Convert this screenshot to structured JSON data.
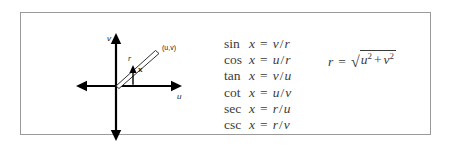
{
  "figure": {
    "frame_color": "#9a9a9a",
    "background": "#ffffff",
    "text_color": "#3b3b3b"
  },
  "diagram": {
    "vertical_axis_label": "v",
    "horizontal_axis_label": "u",
    "point_label": "(u,v)",
    "radius_label": "r",
    "angle_label": "x",
    "origin": {
      "x": 40,
      "y": 59
    },
    "point": {
      "x": 80,
      "y": 26
    },
    "axis_color": "#000000"
  },
  "identities": [
    {
      "fn": "sin",
      "arg": "x",
      "eq": "=",
      "num": "v",
      "slash": "/",
      "den": "r"
    },
    {
      "fn": "cos",
      "arg": "x",
      "eq": "=",
      "num": "u",
      "slash": "/",
      "den": "r"
    },
    {
      "fn": "tan",
      "arg": "x",
      "eq": "=",
      "num": "v",
      "slash": "/",
      "den": "u"
    },
    {
      "fn": "cot",
      "arg": "x",
      "eq": "=",
      "num": "u",
      "slash": "/",
      "den": "v"
    },
    {
      "fn": "sec",
      "arg": "x",
      "eq": "=",
      "num": "r",
      "slash": "/",
      "den": "u"
    },
    {
      "fn": "csc",
      "arg": "x",
      "eq": "=",
      "num": "r",
      "slash": "/",
      "den": "v"
    }
  ],
  "radius_formula": {
    "lhs": "r",
    "eq": "=",
    "radical": "√",
    "term1": "u",
    "exp1": "2",
    "operator": "+",
    "term2": "v",
    "exp2": "2"
  }
}
